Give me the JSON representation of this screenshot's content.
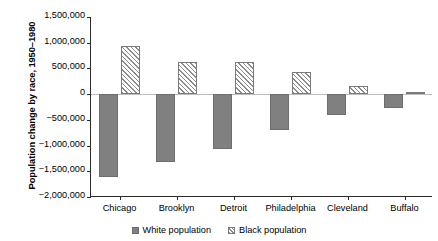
{
  "chart_data": {
    "type": "bar",
    "title": "",
    "xlabel": "",
    "ylabel": "Population change by race, 1950–1980",
    "categories": [
      "Chicago",
      "Brooklyn",
      "Detroit",
      "Philadelphia",
      "Cleveland",
      "Buffalo"
    ],
    "series": [
      {
        "name": "White population",
        "color": "#808080",
        "pattern": "solid",
        "values": [
          -1620000,
          -1320000,
          -1060000,
          -700000,
          -400000,
          -270000
        ]
      },
      {
        "name": "Black population",
        "color": "#8c8c8c",
        "pattern": "diagonal-hatch",
        "values": [
          930000,
          620000,
          625000,
          430000,
          150000,
          50000
        ]
      }
    ],
    "ylim": [
      -2000000,
      1500000
    ],
    "yticks": [
      1500000,
      1000000,
      500000,
      0,
      -500000,
      -1000000,
      -1500000,
      -2000000
    ],
    "ytick_labels": [
      "1,500,000",
      "1,000,000",
      "500,000",
      "0",
      "−500,000",
      "−1,000,000",
      "−1,500,000",
      "−2,000,000"
    ],
    "grid": false,
    "legend_position": "bottom"
  },
  "legend": {
    "items": [
      {
        "label": "White population"
      },
      {
        "label": "Black population"
      }
    ]
  }
}
